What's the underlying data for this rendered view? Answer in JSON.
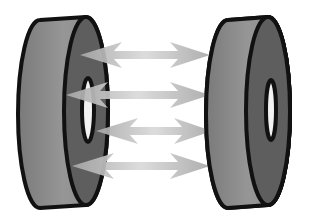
{
  "figure": {
    "colors": {
      "background": "#ffffff",
      "outline": "#111111",
      "disc_side": "#8c8c8c",
      "disc_face": "#5e5e5e",
      "hole": "#f4f4f4",
      "arrow_light": "#d8d8d8",
      "arrow_dark": "#a8a8a8"
    },
    "discs": [
      {
        "name": "left-disc"
      },
      {
        "name": "right-disc"
      }
    ],
    "arrows": [
      {
        "name": "arrow-1"
      },
      {
        "name": "arrow-2"
      },
      {
        "name": "arrow-3"
      },
      {
        "name": "arrow-4"
      }
    ]
  }
}
